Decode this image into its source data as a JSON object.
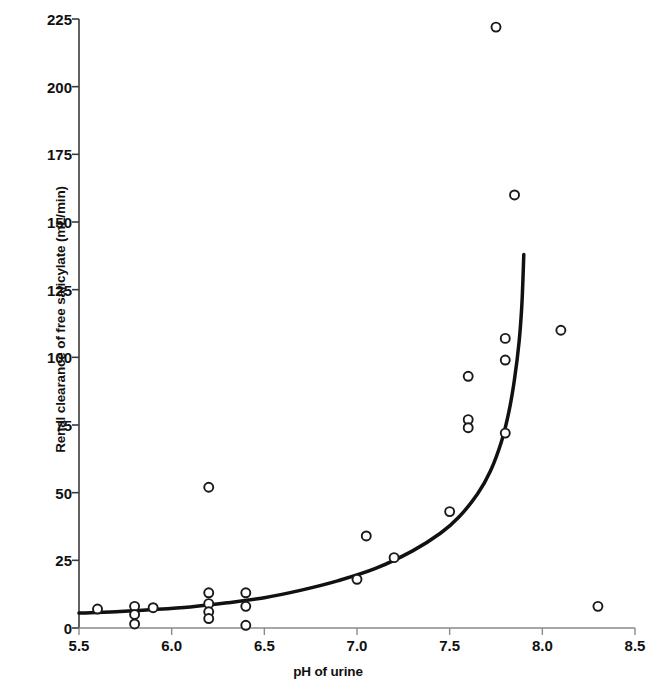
{
  "chart_data": {
    "type": "scatter",
    "title": "",
    "xlabel": "pH of urine",
    "ylabel": "Renal clearance of free salicylate (mL/min)",
    "xlim": [
      5.5,
      8.5
    ],
    "ylim": [
      0,
      225
    ],
    "xticks": [
      5.5,
      6.0,
      6.5,
      7.0,
      7.5,
      8.0,
      8.5
    ],
    "xtick_labels": [
      "5.5",
      "6.0",
      "6.5",
      "7.0",
      "7.5",
      "8.0",
      "8.5"
    ],
    "yticks": [
      0,
      25,
      50,
      75,
      100,
      125,
      150,
      175,
      200,
      225
    ],
    "ytick_labels": [
      "0",
      "25",
      "50",
      "75",
      "100",
      "125",
      "150",
      "175",
      "200",
      "225"
    ],
    "grid": false,
    "legend": null,
    "marker": {
      "shape": "open-circle",
      "edge_color": "#1a1a1a",
      "fill_color": "#ffffff",
      "size_px": 9
    },
    "points": [
      {
        "x": 5.6,
        "y": 7
      },
      {
        "x": 5.8,
        "y": 8
      },
      {
        "x": 5.8,
        "y": 5
      },
      {
        "x": 5.8,
        "y": 1.5
      },
      {
        "x": 5.9,
        "y": 7.5
      },
      {
        "x": 6.2,
        "y": 52
      },
      {
        "x": 6.2,
        "y": 13
      },
      {
        "x": 6.2,
        "y": 9
      },
      {
        "x": 6.2,
        "y": 6
      },
      {
        "x": 6.2,
        "y": 3.5
      },
      {
        "x": 6.4,
        "y": 13
      },
      {
        "x": 6.4,
        "y": 8
      },
      {
        "x": 6.4,
        "y": 1
      },
      {
        "x": 7.0,
        "y": 18
      },
      {
        "x": 7.05,
        "y": 34
      },
      {
        "x": 7.2,
        "y": 26
      },
      {
        "x": 7.5,
        "y": 43
      },
      {
        "x": 7.6,
        "y": 93
      },
      {
        "x": 7.6,
        "y": 77
      },
      {
        "x": 7.6,
        "y": 74
      },
      {
        "x": 7.75,
        "y": 222
      },
      {
        "x": 7.8,
        "y": 107
      },
      {
        "x": 7.8,
        "y": 99
      },
      {
        "x": 7.8,
        "y": 72
      },
      {
        "x": 7.85,
        "y": 160
      },
      {
        "x": 8.1,
        "y": 110
      },
      {
        "x": 8.3,
        "y": 8
      }
    ],
    "fit_curve": {
      "name": "fitted exponential trend",
      "color": "#111111",
      "width_px": 3.5,
      "points": [
        {
          "x": 5.5,
          "y": 5.5
        },
        {
          "x": 5.7,
          "y": 6.0
        },
        {
          "x": 5.9,
          "y": 6.8
        },
        {
          "x": 6.1,
          "y": 7.8
        },
        {
          "x": 6.3,
          "y": 9.3
        },
        {
          "x": 6.5,
          "y": 11.2
        },
        {
          "x": 6.7,
          "y": 14.0
        },
        {
          "x": 6.9,
          "y": 17.5
        },
        {
          "x": 7.1,
          "y": 22.0
        },
        {
          "x": 7.3,
          "y": 28.5
        },
        {
          "x": 7.45,
          "y": 35.0
        },
        {
          "x": 7.55,
          "y": 41.0
        },
        {
          "x": 7.65,
          "y": 49.5
        },
        {
          "x": 7.72,
          "y": 58.0
        },
        {
          "x": 7.78,
          "y": 69.0
        },
        {
          "x": 7.82,
          "y": 80.0
        },
        {
          "x": 7.85,
          "y": 92.0
        },
        {
          "x": 7.875,
          "y": 106.0
        },
        {
          "x": 7.89,
          "y": 120.0
        },
        {
          "x": 7.9,
          "y": 138.0
        }
      ]
    }
  },
  "axes": {
    "y_axis_title": "Renal clearance of free salicylate (mL/min)",
    "x_axis_title": "pH of urine"
  }
}
